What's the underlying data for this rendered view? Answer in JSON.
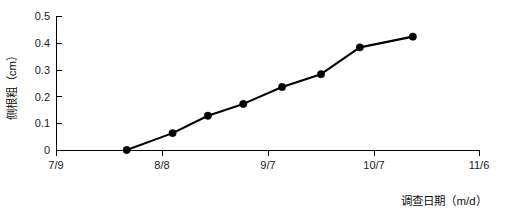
{
  "chart_data": {
    "type": "line",
    "title": "",
    "xlabel": "调查日期（m/d）",
    "ylabel": "侧根粗（cm）",
    "x_tick_labels": [
      "7/9",
      "8/8",
      "9/7",
      "10/7",
      "11/6"
    ],
    "x_tick_days": [
      0,
      30,
      60,
      90,
      120
    ],
    "y_tick_labels": [
      "0",
      "0.1",
      "0.2",
      "0.3",
      "0.4",
      "0.5"
    ],
    "y_tick_values": [
      0,
      0.1,
      0.2,
      0.3,
      0.4,
      0.5
    ],
    "xlim_days": [
      0,
      120
    ],
    "ylim": [
      0,
      0.5
    ],
    "grid": false,
    "legend": "none",
    "marker": "filled-circle",
    "line_color": "#000000",
    "marker_color": "#000000",
    "series": [
      {
        "name": "侧根粗",
        "x_labels": [
          "7/29",
          "8/11",
          "8/22",
          "9/1",
          "9/8",
          "9/19",
          "10/1",
          "10/16"
        ],
        "x_days": [
          20,
          33,
          43,
          53,
          64,
          75,
          86,
          101
        ],
        "values": [
          0.0,
          0.063,
          0.128,
          0.172,
          0.235,
          0.283,
          0.383,
          0.423
        ]
      }
    ]
  },
  "axis_labels": {
    "y_axis_title": "侧根粗（cm）",
    "x_axis_title": "调查日期（m/d）"
  }
}
